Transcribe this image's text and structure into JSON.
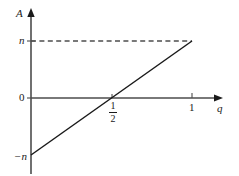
{
  "chart_data": {
    "type": "line",
    "title": "",
    "subtitle": "",
    "xlabel": "q",
    "ylabel": "A",
    "xlim": [
      0,
      1.16
    ],
    "ylim": [
      -1.28,
      1.34
    ],
    "grid": false,
    "legend": null,
    "x_ticks": [
      {
        "value": 0.5,
        "label": "1/2",
        "numerator": "1",
        "denominator": "2"
      },
      {
        "value": 1,
        "label": "1"
      }
    ],
    "y_ticks": [
      {
        "value": 1,
        "label": "n"
      },
      {
        "value": 0,
        "label": "0"
      },
      {
        "value": -1,
        "label": "−n"
      }
    ],
    "series": [
      {
        "name": "A(q)",
        "type": "line",
        "style": "solid",
        "color": "#1a1a1a",
        "points": [
          {
            "x": 0,
            "y": -1
          },
          {
            "x": 0.5,
            "y": 0
          },
          {
            "x": 1,
            "y": 1
          }
        ]
      },
      {
        "name": "A = n reference",
        "type": "line",
        "style": "dashed",
        "color": "#4d4d4d",
        "points": [
          {
            "x": 0,
            "y": 1
          },
          {
            "x": 1,
            "y": 1
          }
        ]
      }
    ],
    "annotations": [],
    "axis_color": "#4d4d4d",
    "text_color": "#1a1a1a",
    "background": "#ffffff"
  },
  "axes": {
    "y_axis_name": "A",
    "x_axis_name": "q",
    "y_label_top": "n",
    "y_label_zero": "0",
    "y_label_bottom": "−n",
    "x_label_half_numerator": "1",
    "x_label_half_denominator": "2",
    "x_label_one": "1"
  }
}
